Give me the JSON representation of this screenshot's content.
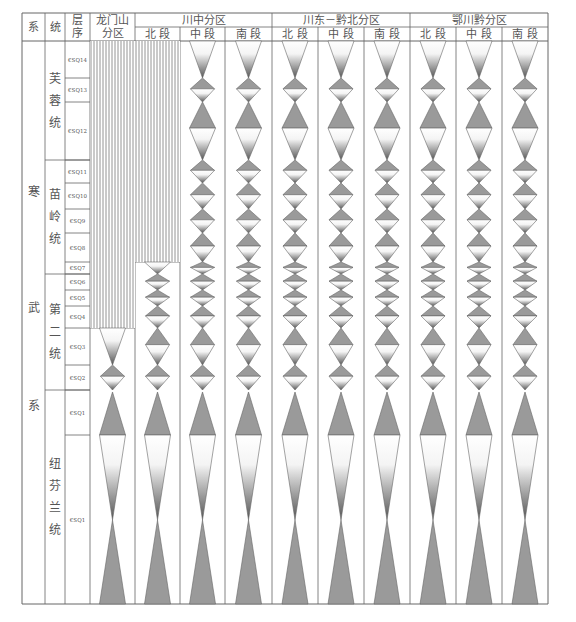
{
  "header": {
    "col_system": "系",
    "col_series": "统",
    "col_sequence": "层序",
    "col_sequence_lines": [
      "层",
      "序"
    ],
    "col_longmenshan_lines": [
      "龙门山",
      "分区"
    ],
    "regions": [
      {
        "name": "川中分区",
        "segments": [
          "北 段",
          "中 段",
          "南 段"
        ]
      },
      {
        "name": "川东－黔北分区",
        "segments": [
          "北 段",
          "中 段",
          "南 段"
        ]
      },
      {
        "name": "鄂川黔分区",
        "segments": [
          "北 段",
          "中 段",
          "南 段"
        ]
      }
    ]
  },
  "system": {
    "name_chars": [
      "寒",
      "武",
      "系"
    ]
  },
  "series": [
    {
      "chars": [
        "芙",
        "蓉",
        "统"
      ],
      "y0": 41,
      "y1": 160
    },
    {
      "chars": [
        "苗",
        "岭",
        "统"
      ],
      "y0": 160,
      "y1": 274
    },
    {
      "chars": [
        "第",
        "二",
        "统"
      ],
      "y0": 274,
      "y1": 390
    },
    {
      "chars": [
        "纽",
        "芬",
        "兰",
        "统"
      ],
      "y0": 390,
      "y1": 604
    }
  ],
  "sequences": [
    {
      "label": "€SQ14",
      "y0": 41,
      "y1": 78
    },
    {
      "label": "€SQ13",
      "y0": 78,
      "y1": 102
    },
    {
      "label": "€SQ12",
      "y0": 102,
      "y1": 160
    },
    {
      "label": "€SQ11",
      "y0": 160,
      "y1": 183
    },
    {
      "label": "€SQ10",
      "y0": 183,
      "y1": 209
    },
    {
      "label": "€SQ9",
      "y0": 209,
      "y1": 233
    },
    {
      "label": "€SQ8",
      "y0": 233,
      "y1": 262
    },
    {
      "label": "€SQ7",
      "y0": 262,
      "y1": 274
    },
    {
      "label": "€SQ6",
      "y0": 274,
      "y1": 290
    },
    {
      "label": "€SQ5",
      "y0": 290,
      "y1": 306
    },
    {
      "label": "€SQ4",
      "y0": 306,
      "y1": 328
    },
    {
      "label": "€SQ3",
      "y0": 328,
      "y1": 365
    },
    {
      "label": "€SQ2",
      "y0": 365,
      "y1": 390
    },
    {
      "label": "€SQ1",
      "y0": 390,
      "y1": 435
    },
    {
      "label": "€SQ1",
      "y0": 435,
      "y1": 604
    }
  ],
  "columns": [
    {
      "key": "longmenshan",
      "x0": 90,
      "x1": 135,
      "hatch_to": 328
    },
    {
      "key": "chuanzhong_north",
      "x0": 135,
      "x1": 180,
      "hatch_to": 262
    },
    {
      "key": "chuanzhong_middle",
      "x0": 180,
      "x1": 225,
      "hatch_to": null
    },
    {
      "key": "chuanzhong_south",
      "x0": 225,
      "x1": 272,
      "hatch_to": null
    },
    {
      "key": "chuandong_north",
      "x0": 272,
      "x1": 318,
      "hatch_to": null
    },
    {
      "key": "chuandong_middle",
      "x0": 318,
      "x1": 364,
      "hatch_to": null
    },
    {
      "key": "chuandong_south",
      "x0": 364,
      "x1": 410,
      "hatch_to": null
    },
    {
      "key": "echuanqian_north",
      "x0": 410,
      "x1": 456,
      "hatch_to": null
    },
    {
      "key": "echuanqian_middle",
      "x0": 456,
      "x1": 502,
      "hatch_to": null
    },
    {
      "key": "echuanqian_south",
      "x0": 502,
      "x1": 548,
      "hatch_to": null
    }
  ],
  "colors": {
    "line": "#666666",
    "fill": "#9a9a9a",
    "hatch": "#777777"
  },
  "caption": ""
}
